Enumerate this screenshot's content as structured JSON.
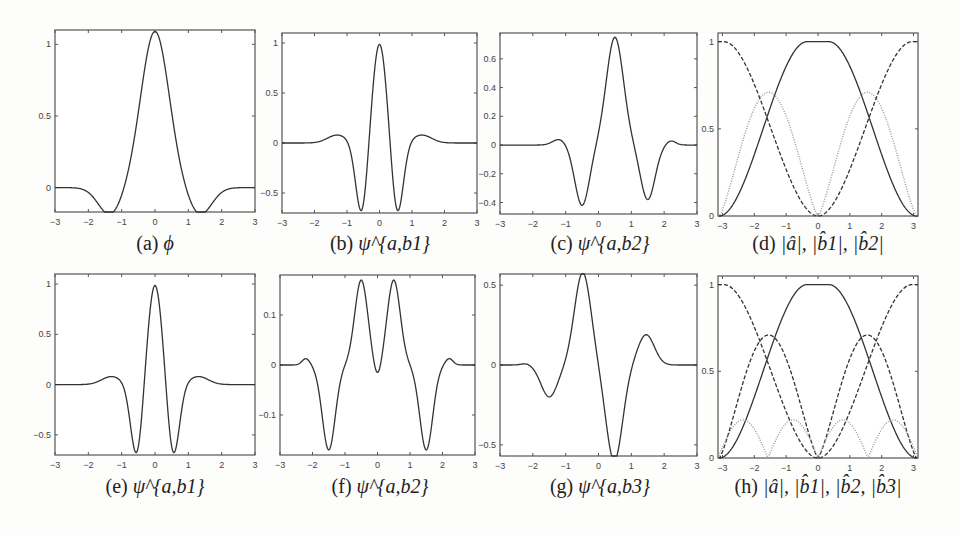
{
  "figure": {
    "panels": [
      {
        "id": "a",
        "caption_label": "(a)",
        "caption_math": "ϕ",
        "xlim": [
          -3,
          3
        ],
        "ylim": [
          -0.17,
          1.1
        ],
        "yticks": [
          0,
          0.5,
          1
        ],
        "ytick_labels": [
          "0",
          "0.5",
          "1"
        ],
        "xticks": [
          -3,
          -2,
          -1,
          0,
          1,
          2,
          3
        ]
      },
      {
        "id": "b",
        "caption_label": "(b)",
        "caption_math": "ψ^{a,b1}",
        "xlim": [
          -3,
          3
        ],
        "ylim": [
          -0.7,
          1.1
        ],
        "yticks": [
          -0.5,
          0,
          0.5,
          1
        ],
        "ytick_labels": [
          "-0.5",
          "0",
          "0.5",
          "1"
        ],
        "xticks": [
          -3,
          -2,
          -1,
          0,
          1,
          2,
          3
        ]
      },
      {
        "id": "c",
        "caption_label": "(c)",
        "caption_math": "ψ^{a,b2}",
        "xlim": [
          -3,
          3
        ],
        "ylim": [
          -0.48,
          0.78
        ],
        "yticks": [
          -0.4,
          -0.2,
          0,
          0.2,
          0.4,
          0.6
        ],
        "ytick_labels": [
          "-0.4",
          "-0.2",
          "0",
          "0.2",
          "0.4",
          "0.6"
        ],
        "xticks": [
          -3,
          -2,
          -1,
          0,
          1,
          2,
          3
        ]
      },
      {
        "id": "d",
        "caption_label": "(d)",
        "caption_math": "|â|, |b̂1|, |b̂2|",
        "xlim": [
          -3.14,
          3.14
        ],
        "ylim": [
          0,
          1.05
        ],
        "yticks": [
          0,
          0.5,
          1
        ],
        "ytick_labels": [
          "0",
          "0.5",
          "1"
        ],
        "xticks": [
          -3,
          -2,
          -1,
          0,
          1,
          2,
          3
        ]
      },
      {
        "id": "e",
        "caption_label": "(e)",
        "caption_math": "ψ^{a,b1}",
        "xlim": [
          -3,
          3
        ],
        "ylim": [
          -0.7,
          1.1
        ],
        "yticks": [
          -0.5,
          0,
          0.5,
          1
        ],
        "ytick_labels": [
          "-0.5",
          "0",
          "0.5",
          "1"
        ],
        "xticks": [
          -3,
          -2,
          -1,
          0,
          1,
          2,
          3
        ]
      },
      {
        "id": "f",
        "caption_label": "(f)",
        "caption_math": "ψ^{a,b2}",
        "xlim": [
          -3,
          3
        ],
        "ylim": [
          -0.18,
          0.18
        ],
        "yticks": [
          -0.1,
          0,
          0.1
        ],
        "ytick_labels": [
          "-0.1",
          "0",
          "0.1"
        ],
        "xticks": [
          -3,
          -2,
          -1,
          0,
          1,
          2,
          3
        ]
      },
      {
        "id": "g",
        "caption_label": "(g)",
        "caption_math": "ψ^{a,b3}",
        "xlim": [
          -3,
          3
        ],
        "ylim": [
          -0.57,
          0.57
        ],
        "yticks": [
          -0.5,
          0,
          0.5
        ],
        "ytick_labels": [
          "-0.5",
          "0",
          "0.5"
        ],
        "xticks": [
          -3,
          -2,
          -1,
          0,
          1,
          2,
          3
        ]
      },
      {
        "id": "h",
        "caption_label": "(h)",
        "caption_math": "|â|, |b̂1|, |b̂2, |b̂3|",
        "xlim": [
          -3.14,
          3.14
        ],
        "ylim": [
          0,
          1.05
        ],
        "yticks": [
          0,
          0.5,
          1
        ],
        "ytick_labels": [
          "0",
          "0.5",
          "1"
        ],
        "xticks": [
          -3,
          -2,
          -1,
          0,
          1,
          2,
          3
        ]
      }
    ]
  },
  "chart_data": [
    {
      "type": "line",
      "title": "(a) ϕ",
      "xlabel": "",
      "ylabel": "",
      "ylim": [
        -0.17,
        1.1
      ],
      "x": [
        -3,
        -2,
        -1.3,
        -1,
        -0.5,
        0,
        0.5,
        1,
        1.3,
        2,
        3
      ],
      "series": [
        {
          "name": "phi",
          "values": [
            0,
            0,
            -0.09,
            -0.02,
            0.55,
            1,
            0.55,
            -0.02,
            -0.09,
            0,
            0
          ]
        }
      ]
    },
    {
      "type": "line",
      "title": "(b) ψ^{a,b1}",
      "ylim": [
        -0.7,
        1.1
      ],
      "x": [
        -3,
        -2,
        -1.3,
        -1,
        -0.55,
        0,
        0.55,
        1,
        1.3,
        2,
        3
      ],
      "series": [
        {
          "name": "psi_b1",
          "values": [
            0,
            0,
            0.07,
            0,
            -0.6,
            1,
            -0.6,
            0,
            0.07,
            0,
            0
          ]
        }
      ]
    },
    {
      "type": "line",
      "title": "(c) ψ^{a,b2}",
      "ylim": [
        -0.48,
        0.78
      ],
      "x": [
        -3,
        -2,
        -1.2,
        -0.5,
        0,
        0.5,
        1,
        1.5,
        2.2,
        3
      ],
      "series": [
        {
          "name": "psi_b2",
          "values": [
            0,
            0,
            0.03,
            -0.38,
            0.1,
            0.68,
            0.1,
            -0.34,
            0.02,
            0
          ]
        }
      ]
    },
    {
      "type": "line",
      "title": "(d) |â|, |b̂1|, |b̂2|",
      "ylim": [
        0,
        1.05
      ],
      "x": [
        -3.14,
        -2.5,
        -2,
        -1.57,
        -1,
        -0.5,
        0,
        0.5,
        1,
        1.57,
        2,
        2.5,
        3.14
      ],
      "series": [
        {
          "name": "|a hat| (solid)",
          "values": [
            0,
            0.05,
            0.2,
            0.5,
            0.85,
            0.99,
            1,
            0.99,
            0.85,
            0.5,
            0.2,
            0.05,
            0
          ]
        },
        {
          "name": "|b1 hat| (dotted gray)",
          "values": [
            0,
            0.35,
            0.62,
            0.71,
            0.5,
            0.15,
            0,
            0.15,
            0.5,
            0.71,
            0.62,
            0.35,
            0
          ]
        },
        {
          "name": "|b2 hat| (dashed)",
          "values": [
            1,
            0.93,
            0.78,
            0.5,
            0.15,
            0.02,
            0,
            0.02,
            0.15,
            0.5,
            0.78,
            0.93,
            1
          ]
        }
      ]
    },
    {
      "type": "line",
      "title": "(e) ψ^{a,b1}",
      "ylim": [
        -0.7,
        1.1
      ],
      "x": [
        -3,
        -2,
        -1.3,
        -1,
        -0.55,
        0,
        0.55,
        1,
        1.3,
        2,
        3
      ],
      "series": [
        {
          "name": "psi_b1",
          "values": [
            0,
            0,
            0.07,
            0,
            -0.6,
            1,
            -0.6,
            0,
            0.07,
            0,
            0
          ]
        }
      ]
    },
    {
      "type": "line",
      "title": "(f) ψ^{a,b2}",
      "ylim": [
        -0.18,
        0.18
      ],
      "x": [
        -3,
        -2.5,
        -2.2,
        -1.5,
        -0.5,
        0,
        0.5,
        1.5,
        2.2,
        2.5,
        3
      ],
      "series": [
        {
          "name": "psi_b2",
          "values": [
            0,
            0,
            0.01,
            -0.155,
            0.15,
            0,
            0.15,
            -0.155,
            0.01,
            0,
            0
          ]
        }
      ]
    },
    {
      "type": "line",
      "title": "(g) ψ^{a,b3}",
      "ylim": [
        -0.57,
        0.57
      ],
      "x": [
        -3,
        -2.2,
        -1.5,
        -1,
        -0.5,
        0,
        0.5,
        1,
        1.5,
        2,
        3
      ],
      "series": [
        {
          "name": "psi_b3",
          "values": [
            0,
            0.01,
            -0.18,
            -0.02,
            0.52,
            0.05,
            -0.54,
            0.02,
            0.17,
            -0.01,
            0
          ]
        }
      ]
    },
    {
      "type": "line",
      "title": "(h) |â|, |b̂1|, |b̂2|, |b̂3|",
      "ylim": [
        0,
        1.05
      ],
      "x": [
        -3.14,
        -2.2,
        -1.57,
        -1,
        0,
        1,
        1.57,
        2.2,
        3.14
      ],
      "series": [
        {
          "name": "|a hat| (solid)",
          "values": [
            0,
            0.12,
            0.5,
            0.85,
            1,
            0.85,
            0.5,
            0.12,
            0
          ]
        },
        {
          "name": "|b1 hat| (dashed)",
          "values": [
            1,
            0.8,
            0.5,
            0.15,
            0,
            0.15,
            0.5,
            0.8,
            1
          ]
        },
        {
          "name": "|b2 hat| (dashed)",
          "values": [
            0,
            0.55,
            0.71,
            0.5,
            0,
            0.5,
            0.71,
            0.55,
            0
          ]
        },
        {
          "name": "|b3 hat| (dotted gray)",
          "values": [
            0,
            0.22,
            0,
            0.22,
            0,
            0.22,
            0,
            0.22,
            0
          ]
        }
      ]
    }
  ]
}
